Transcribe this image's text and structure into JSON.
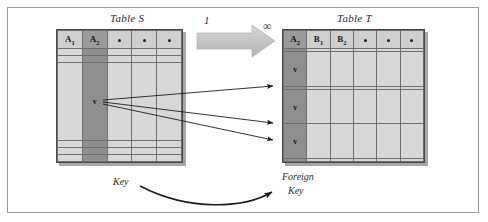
{
  "figure": {
    "frame_border_color": "#9a9a9a",
    "background": "#ffffff"
  },
  "colors": {
    "cell_fill": "#d8d8d8",
    "header_fill": "#cfcfcf",
    "key_column_fill": "#8f8f8f",
    "grid_line": "#6e6e6e",
    "table_border": "#4a4a4a",
    "arrow_block_fill": "#c9c9c9",
    "line_color": "#1c1c1c",
    "text_color": "#2b2b2b"
  },
  "table_s": {
    "title": "Table S",
    "columns": [
      "A1",
      "A2",
      "dot",
      "dot",
      "dot"
    ],
    "column_labels": [
      "A",
      "A",
      "•",
      "•",
      "•"
    ],
    "column_subscripts": [
      "1",
      "2",
      "",
      "",
      ""
    ],
    "key_column_index": 1,
    "row_count": 6,
    "rows": [
      {
        "values": [
          "",
          "",
          "",
          "",
          ""
        ]
      },
      {
        "values": [
          "",
          "",
          "",
          "",
          ""
        ]
      },
      {
        "values": [
          "",
          "v",
          "",
          "",
          ""
        ]
      },
      {
        "values": [
          "",
          "",
          "",
          "",
          ""
        ]
      },
      {
        "values": [
          "",
          "",
          "",
          "",
          ""
        ]
      },
      {
        "values": [
          "",
          "",
          "",
          "",
          ""
        ]
      }
    ],
    "key_value_label": "v",
    "annotation": "Key"
  },
  "table_t": {
    "title": "Table T",
    "columns": [
      "A2",
      "B1",
      "B2",
      "dot",
      "dot",
      "dot"
    ],
    "column_labels": [
      "A",
      "B",
      "B",
      "•",
      "•",
      "•"
    ],
    "column_subscripts": [
      "2",
      "1",
      "2",
      "",
      "",
      ""
    ],
    "key_column_index": 0,
    "row_count": 6,
    "rows": [
      {
        "values": [
          "",
          "",
          "",
          "",
          "",
          ""
        ]
      },
      {
        "values": [
          "v",
          "",
          "",
          "",
          "",
          ""
        ]
      },
      {
        "values": [
          "",
          "",
          "",
          "",
          "",
          ""
        ]
      },
      {
        "values": [
          "v",
          "",
          "",
          "",
          "",
          ""
        ]
      },
      {
        "values": [
          "v",
          "",
          "",
          "",
          "",
          ""
        ]
      },
      {
        "values": [
          "",
          "",
          "",
          "",
          "",
          ""
        ]
      }
    ],
    "key_value_label": "v",
    "annotation_line1": "Foreign",
    "annotation_line2": "Key"
  },
  "relationship": {
    "left_cardinality": "1",
    "right_cardinality": "∞",
    "arrow_direction": "left-to-right",
    "match_arrow_count": 3
  }
}
